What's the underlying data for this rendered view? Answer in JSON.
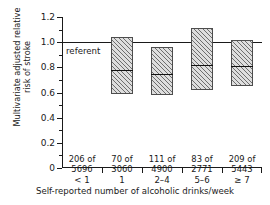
{
  "chart_data": {
    "type": "bar",
    "title": "",
    "xlabel": "Self-reported number of alcoholic drinks/week",
    "ylabel_lines": [
      "Multivariate adjusted relative",
      "risk of stroke"
    ],
    "ylabel": "Multivariate adjusted relative risk of stroke",
    "categories": [
      "< 1",
      "1",
      "2–4",
      "5–6",
      "≥ 7"
    ],
    "values": [
      1.0,
      0.78,
      0.75,
      0.82,
      0.81
    ],
    "ci_low": [
      null,
      0.59,
      0.58,
      0.62,
      0.65
    ],
    "ci_high": [
      null,
      1.04,
      0.96,
      1.11,
      1.02
    ],
    "ylim": [
      0,
      1.2
    ],
    "ytick_values": [
      0,
      0.2,
      0.4,
      0.6,
      0.8,
      1.0,
      1.2
    ],
    "ytick_labels": [
      "0",
      "0.2",
      "0.4",
      "0.6",
      "0.8",
      "1.0",
      "1.2"
    ],
    "yminor_values": [
      0.1,
      0.3,
      0.5,
      0.7,
      0.9,
      1.1
    ],
    "grid": false,
    "legend": "none",
    "reference_line": 1.0,
    "reference_label": "referent",
    "annotations": [
      {
        "category": "< 1",
        "cases": "206 of",
        "total": "5696"
      },
      {
        "category": "1",
        "cases": "70 of",
        "total": "3060"
      },
      {
        "category": "2–4",
        "cases": "111 of",
        "total": "4900"
      },
      {
        "category": "5–6",
        "cases": "83 of",
        "total": "2771"
      },
      {
        "category": "≥ 7",
        "cases": "209 of",
        "total": "5443"
      }
    ],
    "counts_baseline_value": 0.115,
    "colors": {
      "axis": "#1a1a1a",
      "box_fill": "#dedede",
      "box_edge": "#4d4d4d",
      "estimate_line": "#111111",
      "background": "#ffffff"
    }
  }
}
